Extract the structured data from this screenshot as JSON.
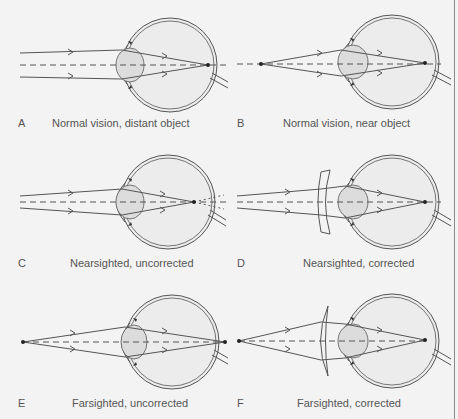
{
  "figure": {
    "panels": [
      {
        "letter": "A",
        "caption": "Normal vision, distant object"
      },
      {
        "letter": "B",
        "caption": "Normal vision, near object"
      },
      {
        "letter": "C",
        "caption": "Nearsighted, uncorrected"
      },
      {
        "letter": "D",
        "caption": "Nearsighted, corrected"
      },
      {
        "letter": "E",
        "caption": "Farsighted, uncorrected"
      },
      {
        "letter": "F",
        "caption": "Farsighted, corrected"
      }
    ],
    "colors": {
      "background": "#f3f3f3",
      "line": "#555555",
      "lens_fill": "#dcdcdc",
      "text": "#555555"
    }
  }
}
